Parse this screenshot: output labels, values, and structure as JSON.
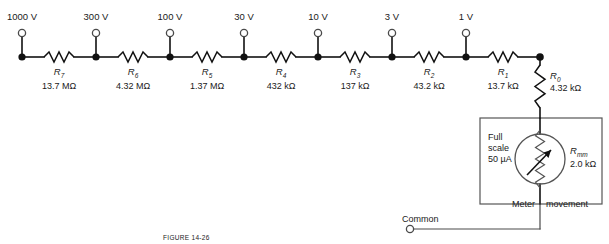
{
  "figure": {
    "caption": "FIGURE 14-26"
  },
  "bus": {
    "y": 57,
    "start_x": 22,
    "end_x": 540
  },
  "range_terminals": [
    {
      "label": "1000 V",
      "x": 22,
      "node_x": 22
    },
    {
      "label": "300 V",
      "x": 96,
      "node_x": 96
    },
    {
      "label": "100 V",
      "x": 170,
      "node_x": 170
    },
    {
      "label": "30 V",
      "x": 244,
      "node_x": 244
    },
    {
      "label": "10 V",
      "x": 318,
      "node_x": 318
    },
    {
      "label": "3 V",
      "x": 392,
      "node_x": 392
    },
    {
      "label": "1 V",
      "x": 466,
      "node_x": 466
    }
  ],
  "series_resistors": [
    {
      "name": "R",
      "sub": "7",
      "value": "13.7 MΩ",
      "cx": 59,
      "from_x": 22,
      "to_x": 96
    },
    {
      "name": "R",
      "sub": "6",
      "value": "4.32 MΩ",
      "cx": 133,
      "from_x": 96,
      "to_x": 170
    },
    {
      "name": "R",
      "sub": "5",
      "value": "1.37 MΩ",
      "cx": 207,
      "from_x": 170,
      "to_x": 244
    },
    {
      "name": "R",
      "sub": "4",
      "value": "432 kΩ",
      "cx": 281,
      "from_x": 244,
      "to_x": 318
    },
    {
      "name": "R",
      "sub": "3",
      "value": "137 kΩ",
      "cx": 355,
      "from_x": 318,
      "to_x": 392
    },
    {
      "name": "R",
      "sub": "2",
      "value": "43.2 kΩ",
      "cx": 429,
      "from_x": 392,
      "to_x": 466
    },
    {
      "name": "R",
      "sub": "1",
      "value": "13.7 kΩ",
      "cx": 503,
      "from_x": 466,
      "to_x": 540
    }
  ],
  "shunt_resistor": {
    "name": "R",
    "sub": "0",
    "value": "4.32 kΩ",
    "x": 540,
    "top_y": 57,
    "bottom_y": 112
  },
  "meter": {
    "box": {
      "x": 480,
      "y": 118,
      "width": 122,
      "height": 86
    },
    "full_scale_line1": "Full",
    "full_scale_line2": "scale",
    "full_scale_line3": "50 µA",
    "resistance_name": "R",
    "resistance_sub": "mm",
    "resistance_value": "2.0 kΩ",
    "caption_left": "Meter",
    "caption_right": "movement"
  },
  "common_terminal": {
    "label": "Common",
    "x": 410,
    "y": 229,
    "wire_to_x": 540
  },
  "colors": {
    "wire": "#111111",
    "node": "#111111",
    "outline": "#555555",
    "background": "#ffffff",
    "text": "#1a1a1a",
    "caption": "#9a9a9a"
  }
}
